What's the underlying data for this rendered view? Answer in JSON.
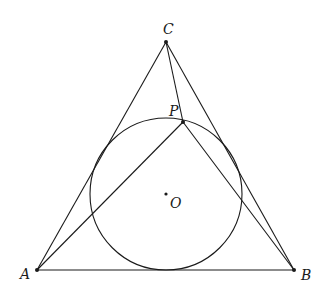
{
  "diagram": {
    "points": {
      "A": {
        "label": "A",
        "x": 37,
        "y": 270
      },
      "B": {
        "label": "B",
        "x": 294,
        "y": 270
      },
      "C": {
        "label": "C",
        "x": 166,
        "y": 42
      },
      "P": {
        "label": "P",
        "x": 183,
        "y": 122
      },
      "O": {
        "label": "O",
        "x": 166,
        "y": 194
      }
    },
    "circle": {
      "center": "O",
      "radius": 76
    },
    "segments": [
      [
        "A",
        "B"
      ],
      [
        "B",
        "C"
      ],
      [
        "C",
        "A"
      ],
      [
        "C",
        "P"
      ],
      [
        "A",
        "P"
      ],
      [
        "P",
        "B"
      ]
    ],
    "colors": {
      "stroke": "#1a1a1a",
      "background": "#ffffff"
    }
  }
}
